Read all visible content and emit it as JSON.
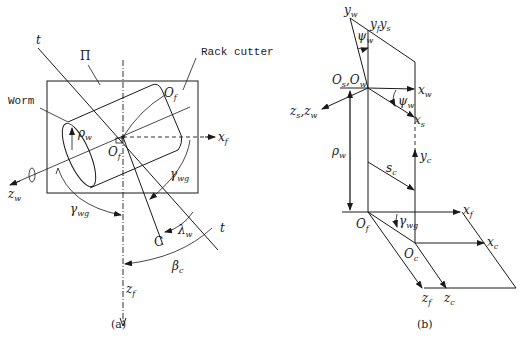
{
  "figure": {
    "panels": [
      {
        "id": "a",
        "caption": "(a)",
        "labels": {
          "t_top": "t",
          "plane": "Π",
          "rack_cutter": "Rack cutter",
          "worm": "Worm",
          "O_f_top": "O",
          "O_f_top_sub": "f",
          "rho": "ρ",
          "rho_sub": "w",
          "x": "x",
          "x_sub": "f",
          "O_center": "O",
          "O_center_sub": "f",
          "gamma_right": "γ",
          "gamma_right_sub": "wg",
          "z_w": "z",
          "z_w_sub": "w",
          "gamma_left": "γ",
          "gamma_left_sub": "wg",
          "C": "C",
          "lambda": "λ",
          "lambda_sub": "w",
          "t_bottom": "t",
          "beta": "β",
          "beta_sub": "c",
          "z_f": "z",
          "z_f_sub": "f"
        }
      },
      {
        "id": "b",
        "caption": "(b)",
        "labels": {
          "y_w": "y",
          "y_w_sub": "w",
          "y_f_y_s": "y",
          "y_f_sub": "f",
          "y_s": "y",
          "y_s_sub": "s",
          "psi_top": "ψ",
          "psi_top_sub": "w",
          "O_s": "O",
          "O_s_sub": "s",
          "O_w": "O",
          "O_w_sub": "w",
          "x_w": "x",
          "x_w_sub": "w",
          "psi_right": "ψ",
          "psi_right_sub": "w",
          "x_s": "x",
          "x_s_sub": "s",
          "z_s": "z",
          "z_s_sub": "s",
          "z_w": "z",
          "z_w_sub": "w",
          "rho": "ρ",
          "rho_sub": "w",
          "s_c": "s",
          "s_c_sub": "c",
          "y_c": "y",
          "y_c_sub": "c",
          "x_f": "x",
          "x_f_sub": "f",
          "O_f": "O",
          "O_f_sub": "f",
          "gamma": "γ",
          "gamma_sub": "wg",
          "x_c": "x",
          "x_c_sub": "c",
          "O_c": "O",
          "O_c_sub": "c",
          "z_f": "z",
          "z_f_sub": "f",
          "z_c": "z",
          "z_c_sub": "c"
        }
      }
    ]
  }
}
